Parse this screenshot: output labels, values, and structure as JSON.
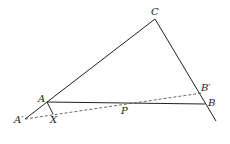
{
  "diagram": {
    "labels": {
      "C": "C",
      "A": "A",
      "B": "B",
      "A_prime": "A′",
      "B_prime": "B′",
      "P": "P",
      "X": "X"
    },
    "points": {
      "C": [
        155,
        19
      ],
      "A": [
        47,
        102
      ],
      "B": [
        205,
        104
      ],
      "A_prime": [
        25,
        119
      ],
      "B_prime": [
        202,
        93
      ],
      "P": [
        125,
        105
      ],
      "X": [
        53,
        114
      ],
      "CB_end": [
        216,
        121
      ]
    },
    "colors": {
      "line": "#222222",
      "dashed": "#444444"
    }
  }
}
